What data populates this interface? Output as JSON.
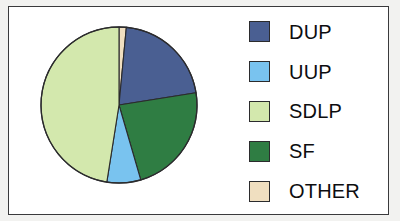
{
  "figure": {
    "background_color": "#f2f2f0",
    "panel_color": "#ffffff",
    "border_color": "#3a3a3c"
  },
  "legend": {
    "position": "right",
    "items": [
      {
        "label": "DUP",
        "color": "#4a5f92",
        "border": "#2b2b2d",
        "swatch_name": "legend-swatch-dup"
      },
      {
        "label": "UUP",
        "color": "#79c3ef",
        "border": "#2b2b2d",
        "swatch_name": "legend-swatch-uup"
      },
      {
        "label": "SDLP",
        "color": "#d3e8ad",
        "border": "#2b2b2d",
        "swatch_name": "legend-swatch-sdlp"
      },
      {
        "label": "SF",
        "color": "#2f7d43",
        "border": "#2b2b2d",
        "swatch_name": "legend-swatch-sf"
      },
      {
        "label": "OTHER",
        "color": "#f0dfc0",
        "border": "#2b2b2d",
        "swatch_name": "legend-swatch-other"
      }
    ]
  },
  "chart_data": {
    "type": "pie",
    "title": "",
    "subtitle": "",
    "xlabel": "",
    "ylabel": "",
    "grid": false,
    "legend_position": "right",
    "start_angle_deg": 0,
    "direction": "clockwise",
    "categories": [
      "OTHER",
      "DUP",
      "SF",
      "UUP",
      "SDLP"
    ],
    "values": [
      1.5,
      21.0,
      23.0,
      7.0,
      47.5
    ],
    "units": "percent",
    "slices": [
      {
        "label": "OTHER",
        "value": 1.5,
        "color": "#f0dfc0",
        "start_angle_deg": 0.0,
        "end_angle_deg": 5.4,
        "edge_color": "#2b2b2d"
      },
      {
        "label": "DUP",
        "value": 21.0,
        "color": "#4a5f92",
        "start_angle_deg": 5.4,
        "end_angle_deg": 81.0,
        "edge_color": "#2b2b2d"
      },
      {
        "label": "SF",
        "value": 23.0,
        "color": "#2f7d43",
        "start_angle_deg": 81.0,
        "end_angle_deg": 163.8,
        "edge_color": "#2b2b2d"
      },
      {
        "label": "UUP",
        "value": 7.0,
        "color": "#79c3ef",
        "start_angle_deg": 163.8,
        "end_angle_deg": 189.0,
        "edge_color": "#2b2b2d"
      },
      {
        "label": "SDLP",
        "value": 47.5,
        "color": "#d3e8ad",
        "start_angle_deg": 189.0,
        "end_angle_deg": 360.0,
        "edge_color": "#2b2b2d"
      }
    ],
    "geometry": {
      "center_x": 84,
      "center_y": 84,
      "radius": 78
    }
  }
}
